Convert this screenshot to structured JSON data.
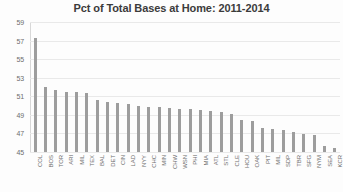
{
  "chart_data": {
    "type": "bar",
    "title": "Pct of Total Bases at Home: 2011-2014",
    "xlabel": "",
    "ylabel": "",
    "ylim": [
      45,
      59
    ],
    "yticks": [
      45,
      47,
      49,
      51,
      53,
      55,
      57,
      59
    ],
    "grid": true,
    "legend": null,
    "bar_color": "#9d9d9d",
    "categories": [
      "COL",
      "BOS",
      "TOR",
      "ARI",
      "MIL",
      "TEX",
      "BAL",
      "DET",
      "CIN",
      "LAD",
      "NYY",
      "CHC",
      "MIN",
      "CHW",
      "WSN",
      "PHI",
      "MIA",
      "ATL",
      "STL",
      "CLE",
      "HOU",
      "OAK",
      "PIT",
      "MIL",
      "SDP",
      "TBR",
      "SFG",
      "NYM",
      "SEA",
      "KCR"
    ],
    "values": [
      57.3,
      52.0,
      51.7,
      51.5,
      51.5,
      51.4,
      50.6,
      50.4,
      50.3,
      50.2,
      50.0,
      49.9,
      49.8,
      49.7,
      49.6,
      49.6,
      49.5,
      49.4,
      49.3,
      49.1,
      48.4,
      48.3,
      47.6,
      47.5,
      47.4,
      47.2,
      46.9,
      46.8,
      45.6,
      45.4
    ]
  }
}
